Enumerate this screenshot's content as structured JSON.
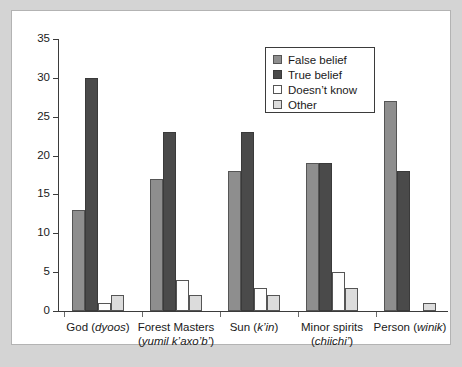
{
  "chart_data": {
    "type": "bar",
    "title": "",
    "xlabel": "",
    "ylabel": "",
    "ylim": [
      0,
      35
    ],
    "ytick_step": 5,
    "yticks": [
      0,
      5,
      10,
      15,
      20,
      25,
      30,
      35
    ],
    "grid": false,
    "legend_position": "top-right",
    "categories": [
      {
        "main": "God (",
        "italic": "dyoos",
        "tail": ")",
        "line2_main": "",
        "line2_italic": "",
        "line2_tail": ""
      },
      {
        "main": "Forest Masters",
        "italic": "",
        "tail": "",
        "line2_main": "(",
        "line2_italic": "yumil k’axo’b’",
        "line2_tail": ")"
      },
      {
        "main": "Sun (",
        "italic": "k’in",
        "tail": ")",
        "line2_main": "",
        "line2_italic": "",
        "line2_tail": ""
      },
      {
        "main": "Minor spirits",
        "italic": "",
        "tail": "",
        "line2_main": "(",
        "line2_italic": "chiichi’",
        "line2_tail": ")"
      },
      {
        "main": "Person (",
        "italic": "winik",
        "tail": ")",
        "line2_main": "",
        "line2_italic": "",
        "line2_tail": ""
      }
    ],
    "category_labels": [
      "God (dyoos)",
      "Forest Masters (yumil k’axo’b’)",
      "Sun (k’in)",
      "Minor spirits (chiichi’)",
      "Person (winik)"
    ],
    "series": [
      {
        "name": "False belief",
        "color": "#8e8e8e",
        "values": [
          13,
          17,
          18,
          19,
          27
        ]
      },
      {
        "name": "True belief",
        "color": "#4a4a4a",
        "values": [
          30,
          23,
          23,
          19,
          18
        ]
      },
      {
        "name": "Doesn't know",
        "color": "#ffffff",
        "values": [
          1,
          4,
          3,
          5,
          0
        ]
      },
      {
        "name": "Other",
        "color": "#dcdcdc",
        "values": [
          2,
          2,
          2,
          3,
          1
        ]
      }
    ]
  },
  "legend": {
    "items": [
      {
        "label": "False belief"
      },
      {
        "label": "True belief"
      },
      {
        "label": "Doesn’t know"
      },
      {
        "label": "Other"
      }
    ]
  },
  "colors": {
    "false_belief": "#8e8e8e",
    "true_belief": "#4a4a4a",
    "doesnt_know": "#ffffff",
    "other": "#dcdcdc",
    "axis": "#3b3b3b",
    "panel_background": "#ffffff",
    "figure_background": "#d4d4d4"
  }
}
